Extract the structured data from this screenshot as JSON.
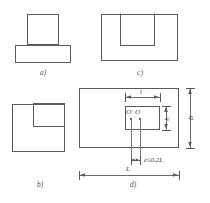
{
  "figure": {
    "panels": [
      {
        "id": "a",
        "caption": "a)",
        "description": "elevation: column on spread footing",
        "shapes": [
          "upper-square",
          "lower-wide-rectangle"
        ]
      },
      {
        "id": "b",
        "caption": "b)",
        "description": "plan: square footing with corner notch square",
        "shapes": [
          "outer-square",
          "corner-square"
        ]
      },
      {
        "id": "c",
        "caption": "c)",
        "description": "elevation: wide rectangle with inner open channel",
        "shapes": [
          "outer-rectangle",
          "inner-u-shape"
        ]
      },
      {
        "id": "d",
        "caption": "d)",
        "description": "plan with dimensions and eccentricity note",
        "shapes": [
          "outer-rectangle",
          "inner-rectangle"
        ],
        "dimensions": {
          "top_small": "l",
          "right_inner": "b",
          "right_outer": "B",
          "bottom_overall": "L"
        },
        "points": {
          "centroid_shifted": "O'",
          "centroid": "O"
        },
        "note": "e≤0.2L"
      }
    ]
  },
  "colors": {
    "stroke": "#5a5a5a",
    "dimension": "#6a6a6a",
    "text": "#3a3a3a",
    "point": "#2a2a2a",
    "background": "#ffffff"
  }
}
